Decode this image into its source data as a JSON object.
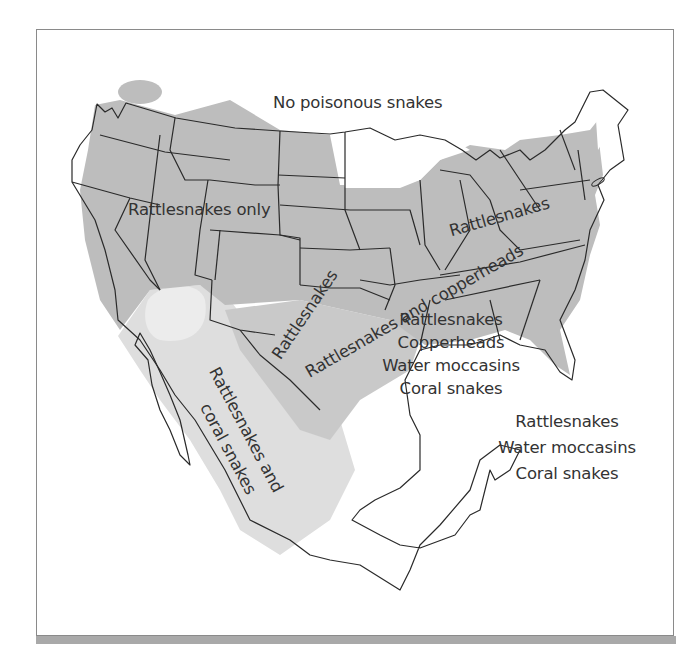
{
  "map": {
    "title": "",
    "subject": "Distribution of venomous snakes in the United States and Mexico",
    "colors": {
      "dark_region": "#bdbdbd",
      "medium_region": "#cbcbcb",
      "light_region": "#dedede",
      "desert_region": "#e8e8e8",
      "outline": "#2a2a2a",
      "label_text": "#333333",
      "frame_shadow": "#a9a9a9"
    },
    "labels": {
      "no_poisonous": "No poisonous snakes",
      "rattlesnakes_only": "Rattlesnakes only",
      "rattlesnakes_west": "Rattlesnakes",
      "rattlesnakes_and_copperheads_a": "Rattlesnakes and copperheads",
      "rattlesnakes_northeast": "Rattlesnakes",
      "southeast": {
        "line1": "Rattlesnakes",
        "line2": "Copperheads",
        "line3": "Water moccasins",
        "line4": "Coral snakes"
      },
      "mexico_west": {
        "line1": "Rattlesnakes and",
        "line2": "coral snakes"
      },
      "mexico_east": {
        "line1": "Rattlesnakes",
        "line2": "Water moccasins",
        "line3": "Coral snakes"
      }
    },
    "legend_regions": [
      {
        "name": "No poisonous snakes",
        "shade": "white"
      },
      {
        "name": "Rattlesnakes only",
        "shade": "dark gray"
      },
      {
        "name": "Rattlesnakes and copperheads",
        "shade": "dark gray"
      },
      {
        "name": "Rattlesnakes, Copperheads, Water moccasins, Coral snakes",
        "shade": "dark gray"
      },
      {
        "name": "Rattlesnakes and coral snakes",
        "shade": "light gray"
      },
      {
        "name": "Rattlesnakes, Water moccasins, Coral snakes",
        "shade": "white"
      }
    ]
  }
}
